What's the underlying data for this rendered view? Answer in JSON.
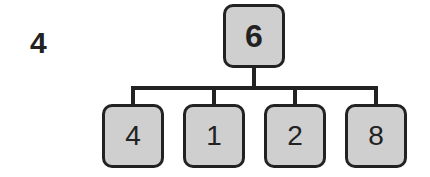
{
  "label": "4",
  "tree": {
    "root": {
      "value": "6"
    },
    "children": [
      {
        "value": "4"
      },
      {
        "value": "1"
      },
      {
        "value": "2"
      },
      {
        "value": "8"
      }
    ]
  },
  "colors": {
    "node_fill": "#cfcfcf",
    "stroke": "#222222",
    "background": "#ffffff"
  }
}
